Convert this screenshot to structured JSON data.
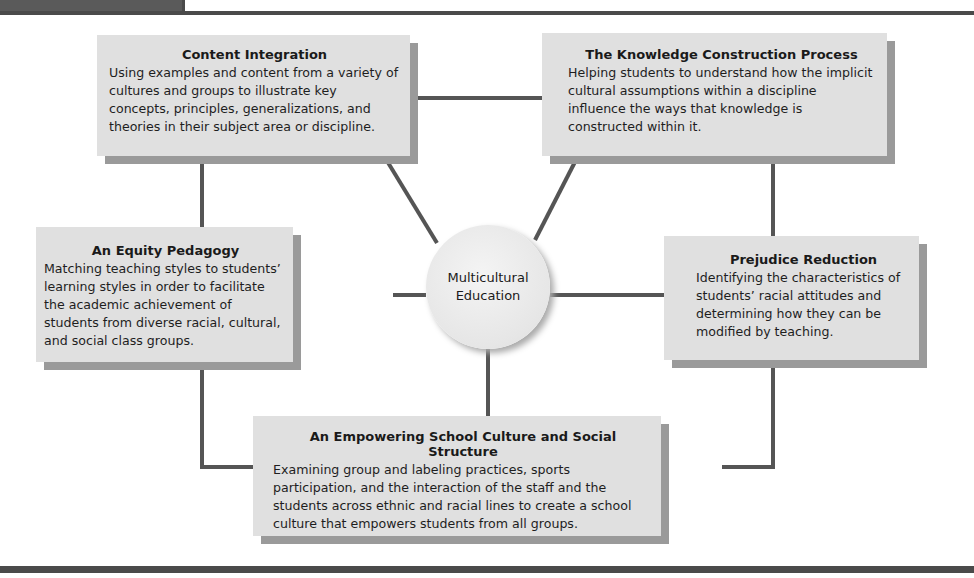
{
  "header": {
    "partial_label": "... ... ... y"
  },
  "hub": {
    "line1": "Multicultural",
    "line2": "Education"
  },
  "dimensions": [
    {
      "id": "content-integration",
      "title": "Content Integration",
      "description": "Using examples and content from a variety of cultures and groups to illustrate key concepts, principles, generalizations, and theories in their subject area or discipline."
    },
    {
      "id": "knowledge-construction",
      "title": "The Knowledge Construction Process",
      "description": "Helping students to understand how the implicit cultural assumptions within a discipline influence the ways that knowledge is constructed within it."
    },
    {
      "id": "equity-pedagogy",
      "title": "An Equity Pedagogy",
      "description": "Matching teaching styles to students’ learning styles in order to facilitate the academic achievement of students from diverse racial, cultural, and social class groups."
    },
    {
      "id": "prejudice-reduction",
      "title": "Prejudice Reduction",
      "description": "Identifying the characteristics of students’ racial attitudes and determining how they can be modified by teaching."
    },
    {
      "id": "empowering-school-culture",
      "title": "An Empowering School Culture and Social Structure",
      "description": "Examining group and labeling practices, sports participation, and the interaction of the staff and the students across ethnic and racial lines to create a school culture that empowers students from all groups."
    }
  ],
  "colors": {
    "box_fill": "#e0e0e0",
    "box_shadow": "#9a9a9a",
    "connector": "#555555",
    "hub_fill": "#ececec",
    "rule": "#4a4a4a"
  }
}
